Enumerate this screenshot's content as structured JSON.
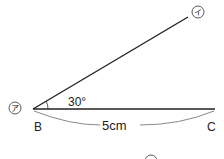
{
  "diagram": {
    "angle_label": "30°",
    "length_label": "5cm",
    "vertex_B": "B",
    "vertex_C": "C",
    "mark_a": "ア",
    "mark_i": "イ",
    "mark_u": "ウ"
  }
}
